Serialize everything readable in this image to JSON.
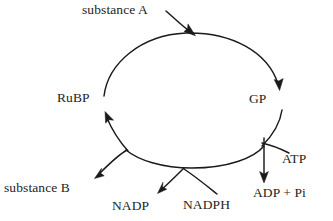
{
  "diagram": {
    "type": "cycle-diagram",
    "background_color": "#ffffff",
    "line_color": "#1a1a1a",
    "text_color": "#242424",
    "nodes": {
      "substance_a": "substance A",
      "rubp": "RuBP",
      "gp": "GP",
      "atp": "ATP",
      "adp_pi": "ADP + Pi",
      "substance_b": "substance B",
      "nadp": "NADP",
      "nadph": "NADPH"
    },
    "arrows": [
      {
        "name": "substance-a-into-cycle",
        "from": "substance A",
        "to": "cycle (top)"
      },
      {
        "name": "rubp-to-gp",
        "from": "RuBP",
        "to": "GP"
      },
      {
        "name": "gp-to-adp-pi",
        "from": "GP branch",
        "to": "ADP + Pi"
      },
      {
        "name": "atp-into-cycle",
        "from": "ATP",
        "to": "cycle (right)"
      },
      {
        "name": "cycle-to-nadp",
        "from": "cycle (bottom)",
        "to": "NADP"
      },
      {
        "name": "nadph-into-cycle",
        "from": "NADPH",
        "to": "cycle (bottom)"
      },
      {
        "name": "cycle-to-substance-b",
        "from": "cycle (lower left)",
        "to": "substance B"
      },
      {
        "name": "cycle-to-rubp",
        "from": "cycle (lower left)",
        "to": "RuBP"
      }
    ]
  }
}
